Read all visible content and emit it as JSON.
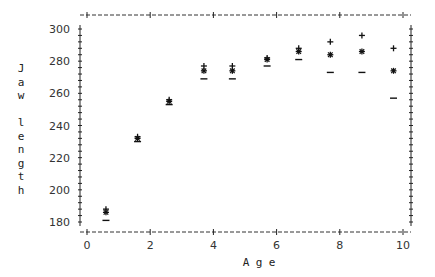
{
  "chart_data": {
    "type": "scatter",
    "title": "",
    "xlabel": "Age",
    "ylabel": "Jaw length",
    "xlim": [
      0,
      10
    ],
    "ylim": [
      172,
      308
    ],
    "xticks": [
      0,
      2,
      4,
      6,
      8,
      10
    ],
    "yticks": [
      180,
      200,
      220,
      240,
      260,
      280,
      300
    ],
    "grid": false,
    "legend": "none",
    "series": [
      {
        "name": "upper",
        "marker": "+",
        "x": [
          0.6,
          1.6,
          2.6,
          3.7,
          4.6,
          5.7,
          6.7,
          7.7,
          8.7,
          9.7
        ],
        "y": [
          188,
          233,
          256,
          277,
          277,
          282,
          288,
          292,
          296,
          288
        ]
      },
      {
        "name": "mean",
        "marker": "*",
        "x": [
          0.6,
          1.6,
          2.6,
          3.7,
          4.6,
          5.7,
          6.7,
          7.7,
          8.7,
          9.7
        ],
        "y": [
          186,
          232,
          255,
          274,
          274,
          281,
          286,
          284,
          286,
          274
        ]
      },
      {
        "name": "lower",
        "marker": "−",
        "x": [
          0.6,
          1.6,
          2.6,
          3.7,
          4.6,
          5.7,
          6.7,
          7.7,
          8.7,
          9.7
        ],
        "y": [
          181,
          230,
          253,
          269,
          269,
          277,
          281,
          273,
          273,
          257
        ]
      }
    ],
    "ylabel_letters": [
      "J",
      "a",
      "w",
      "",
      "l",
      "e",
      "n",
      "g",
      "t",
      "h"
    ],
    "xlabel_letters": [
      "A",
      "g",
      "e"
    ]
  }
}
